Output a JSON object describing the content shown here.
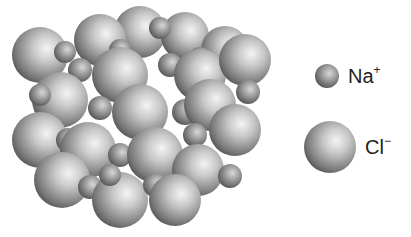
{
  "diagram": {
    "legend": [
      {
        "ion": "sodium",
        "symbol": "Na",
        "charge": "+",
        "relative_size": "small"
      },
      {
        "ion": "chloride",
        "symbol": "Cl",
        "charge": "−",
        "relative_size": "large"
      }
    ],
    "colors": {
      "sphere_highlight": "#f2f2f2",
      "sphere_mid": "#a8a8a8",
      "sphere_shadow": "#4a4a4a",
      "background": "#ffffff"
    }
  }
}
